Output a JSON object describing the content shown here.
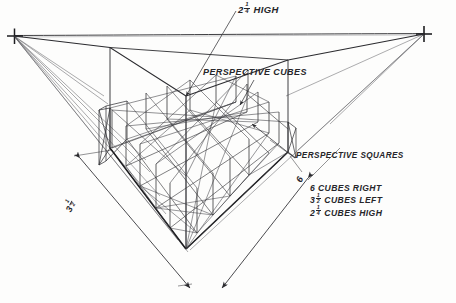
{
  "drawing": {
    "title": "Two-point perspective cube grid construction",
    "medium": "pencil sketch on paper",
    "paper_color": "#fdfdfc",
    "ink_color": "#2b2b2f"
  },
  "labels": {
    "height_callout": {
      "whole": "2",
      "num": "1",
      "den": "4",
      "suffix": "HIGH"
    },
    "perspective_cubes": "PERSPECTIVE CUBES",
    "perspective_squares": "PERSPECTIVE SQUARES",
    "spec_lines": [
      {
        "whole": "6",
        "num": "",
        "den": "",
        "text": "CUBES RIGHT"
      },
      {
        "whole": "3",
        "num": "1",
        "den": "2",
        "text": "CUBES LEFT"
      },
      {
        "whole": "2",
        "num": "1",
        "den": "4",
        "text": "CUBES HIGH"
      }
    ],
    "dimension_left": {
      "whole": "3",
      "num": "1",
      "den": "2"
    },
    "dimension_right": {
      "whole": "6",
      "num": "",
      "den": ""
    }
  },
  "vanishing_points": {
    "left": {
      "x": 14,
      "y": 36,
      "marker": "cross"
    },
    "right": {
      "x": 424,
      "y": 34,
      "marker": "cross"
    }
  },
  "geometry": {
    "near_corner": {
      "x": 186,
      "y": 249
    },
    "box_top_near": {
      "x": 186,
      "y": 96
    },
    "cubes_right": 6,
    "cubes_left": 3.5,
    "cubes_high": 2.25
  }
}
